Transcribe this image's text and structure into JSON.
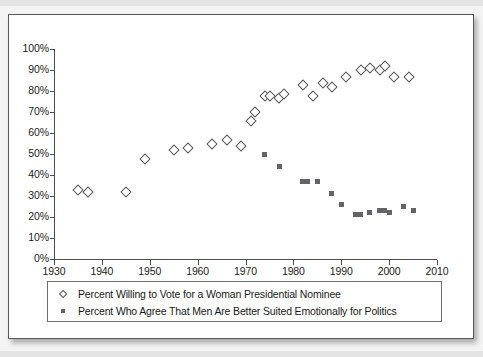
{
  "figure": {
    "background_color": "#ffffff",
    "border_color": "#59595c"
  },
  "chart_data": {
    "type": "scatter",
    "title": "",
    "subtitle": "",
    "xlabel": "",
    "ylabel": "",
    "xlim": [
      1930,
      2010
    ],
    "ylim": [
      0,
      100
    ],
    "xticks": [
      1930,
      1940,
      1950,
      1960,
      1970,
      1980,
      1990,
      2000,
      2010
    ],
    "xtick_labels": [
      "1930",
      "1940",
      "1950",
      "1960",
      "1970",
      "1980",
      "1990",
      "2000",
      "2010"
    ],
    "yticks": [
      0,
      10,
      20,
      30,
      40,
      50,
      60,
      70,
      80,
      90,
      100
    ],
    "ytick_labels": [
      "0%",
      "10%",
      "20%",
      "30%",
      "40%",
      "50%",
      "60%",
      "70%",
      "80%",
      "90%",
      "100%"
    ],
    "grid": false,
    "legend_position": "below-plot",
    "series": [
      {
        "name": "Percent Willing to Vote for a Woman Presidential Nominee",
        "marker": "open-diamond",
        "marker_color": "#58585b",
        "marker_fill": "#ffffff",
        "points": [
          {
            "x": 1935,
            "y": 33
          },
          {
            "x": 1937,
            "y": 32
          },
          {
            "x": 1945,
            "y": 32
          },
          {
            "x": 1949,
            "y": 48
          },
          {
            "x": 1955,
            "y": 52
          },
          {
            "x": 1958,
            "y": 53
          },
          {
            "x": 1963,
            "y": 55
          },
          {
            "x": 1966,
            "y": 57
          },
          {
            "x": 1969,
            "y": 54
          },
          {
            "x": 1971,
            "y": 66
          },
          {
            "x": 1972,
            "y": 70
          },
          {
            "x": 1974,
            "y": 78
          },
          {
            "x": 1975,
            "y": 78
          },
          {
            "x": 1977,
            "y": 77
          },
          {
            "x": 1978,
            "y": 79
          },
          {
            "x": 1982,
            "y": 83
          },
          {
            "x": 1984,
            "y": 78
          },
          {
            "x": 1986,
            "y": 84
          },
          {
            "x": 1988,
            "y": 82
          },
          {
            "x": 1991,
            "y": 87
          },
          {
            "x": 1994,
            "y": 90
          },
          {
            "x": 1996,
            "y": 91
          },
          {
            "x": 1998,
            "y": 90
          },
          {
            "x": 1999,
            "y": 92
          },
          {
            "x": 2001,
            "y": 87
          },
          {
            "x": 2004,
            "y": 87
          }
        ]
      },
      {
        "name": "Percent Who Agree That Men Are Better Suited Emotionally for Politics",
        "marker": "filled-square",
        "marker_color": "#646468",
        "marker_fill": "#646468",
        "points": [
          {
            "x": 1974,
            "y": 50
          },
          {
            "x": 1977,
            "y": 44
          },
          {
            "x": 1982,
            "y": 37
          },
          {
            "x": 1983,
            "y": 37
          },
          {
            "x": 1985,
            "y": 37
          },
          {
            "x": 1988,
            "y": 31
          },
          {
            "x": 1990,
            "y": 26
          },
          {
            "x": 1993,
            "y": 21
          },
          {
            "x": 1994,
            "y": 21
          },
          {
            "x": 1996,
            "y": 22
          },
          {
            "x": 1998,
            "y": 23
          },
          {
            "x": 1999,
            "y": 23
          },
          {
            "x": 2000,
            "y": 22
          },
          {
            "x": 2003,
            "y": 25
          },
          {
            "x": 2005,
            "y": 23
          }
        ]
      }
    ]
  },
  "legend": {
    "entries": [
      {
        "marker": "open-diamond",
        "label": "Percent Willing to Vote for a Woman Presidential Nominee"
      },
      {
        "marker": "filled-square",
        "label": "Percent Who Agree That Men Are Better Suited Emotionally for Politics"
      }
    ]
  }
}
